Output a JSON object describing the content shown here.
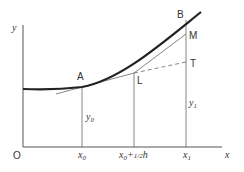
{
  "diagram": {
    "axes": {
      "y_label": "y",
      "x_label": "x",
      "origin_label": "O"
    },
    "points": {
      "A": "A",
      "B": "B",
      "L": "L",
      "M": "M",
      "T": "T"
    },
    "ordinates": {
      "y0": {
        "base": "y",
        "sub": "0"
      },
      "y1": {
        "base": "y",
        "sub": "1"
      }
    },
    "x_ticks": {
      "x0": {
        "base": "x",
        "sub": "0"
      },
      "xmid": {
        "base": "x",
        "sub": "0",
        "suffix": "+",
        "frac": "1/2",
        "var": "h"
      },
      "x1": {
        "base": "x",
        "sub": "1"
      }
    },
    "colors": {
      "line": "#555555",
      "curve": "#222222",
      "text": "#333333"
    }
  }
}
